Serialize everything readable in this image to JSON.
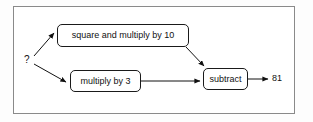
{
  "diagram": {
    "type": "flowchart",
    "title": "",
    "frame": {
      "border_color": "#8a8a8a",
      "background": "#ffffff"
    },
    "nodes": [
      {
        "id": "input",
        "label": "?",
        "shape": "plain-text"
      },
      {
        "id": "square",
        "label": "square and multiply by 10",
        "shape": "rounded-rect"
      },
      {
        "id": "multiply",
        "label": "multiply by 3",
        "shape": "rounded-rect"
      },
      {
        "id": "subtract",
        "label": "subtract",
        "shape": "rounded-rect"
      },
      {
        "id": "result",
        "label": "81",
        "shape": "plain-text"
      }
    ],
    "edges": [
      {
        "from": "input",
        "to": "square",
        "style": "arrow",
        "direction": "up-right"
      },
      {
        "from": "input",
        "to": "multiply",
        "style": "arrow",
        "direction": "down-right"
      },
      {
        "from": "square",
        "to": "subtract",
        "style": "arrow",
        "direction": "down-right"
      },
      {
        "from": "multiply",
        "to": "subtract",
        "style": "arrow",
        "direction": "right"
      },
      {
        "from": "subtract",
        "to": "result",
        "style": "arrow",
        "direction": "right"
      }
    ],
    "stroke_color": "#1a1a1a"
  }
}
